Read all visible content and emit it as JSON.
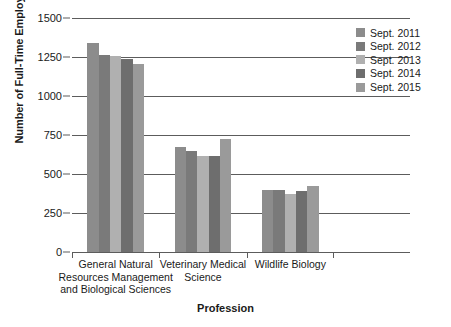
{
  "chart_data": {
    "type": "bar",
    "title": "",
    "xlabel": "Profession",
    "ylabel": "Number of Full-Time Employees",
    "ylim": [
      0,
      1500
    ],
    "yticks": [
      0,
      250,
      500,
      750,
      1000,
      1250,
      1500
    ],
    "ytick_labels": [
      "0",
      "250",
      "500",
      "750",
      "1000",
      "1250",
      "1500"
    ],
    "grid": true,
    "legend_position": "top-right",
    "categories": [
      "General Natural Resources Management and Biological Sciences",
      "Veterinary Medical Science",
      "Wildlife Biology"
    ],
    "category_lines": [
      [
        "General Natural",
        "Resources Management",
        "and Biological Sciences"
      ],
      [
        "Veterinary Medical",
        "Science"
      ],
      [
        "Wildlife Biology"
      ]
    ],
    "series": [
      {
        "name": "Sept. 2011",
        "color": "#8c8c8c",
        "values": [
          1340,
          670,
          395
        ]
      },
      {
        "name": "Sept. 2012",
        "color": "#7a7a7a",
        "values": [
          1262,
          645,
          395
        ]
      },
      {
        "name": "Sept. 2013",
        "color": "#b0b0b0",
        "values": [
          1258,
          615,
          370
        ]
      },
      {
        "name": "Sept. 2014",
        "color": "#6e6e6e",
        "values": [
          1235,
          615,
          392
        ]
      },
      {
        "name": "Sept. 2015",
        "color": "#9a9a9a",
        "values": [
          1208,
          725,
          420
        ]
      }
    ]
  },
  "axis": {
    "y_title": "Number of Full-Time Employees",
    "x_title": "Profession"
  }
}
